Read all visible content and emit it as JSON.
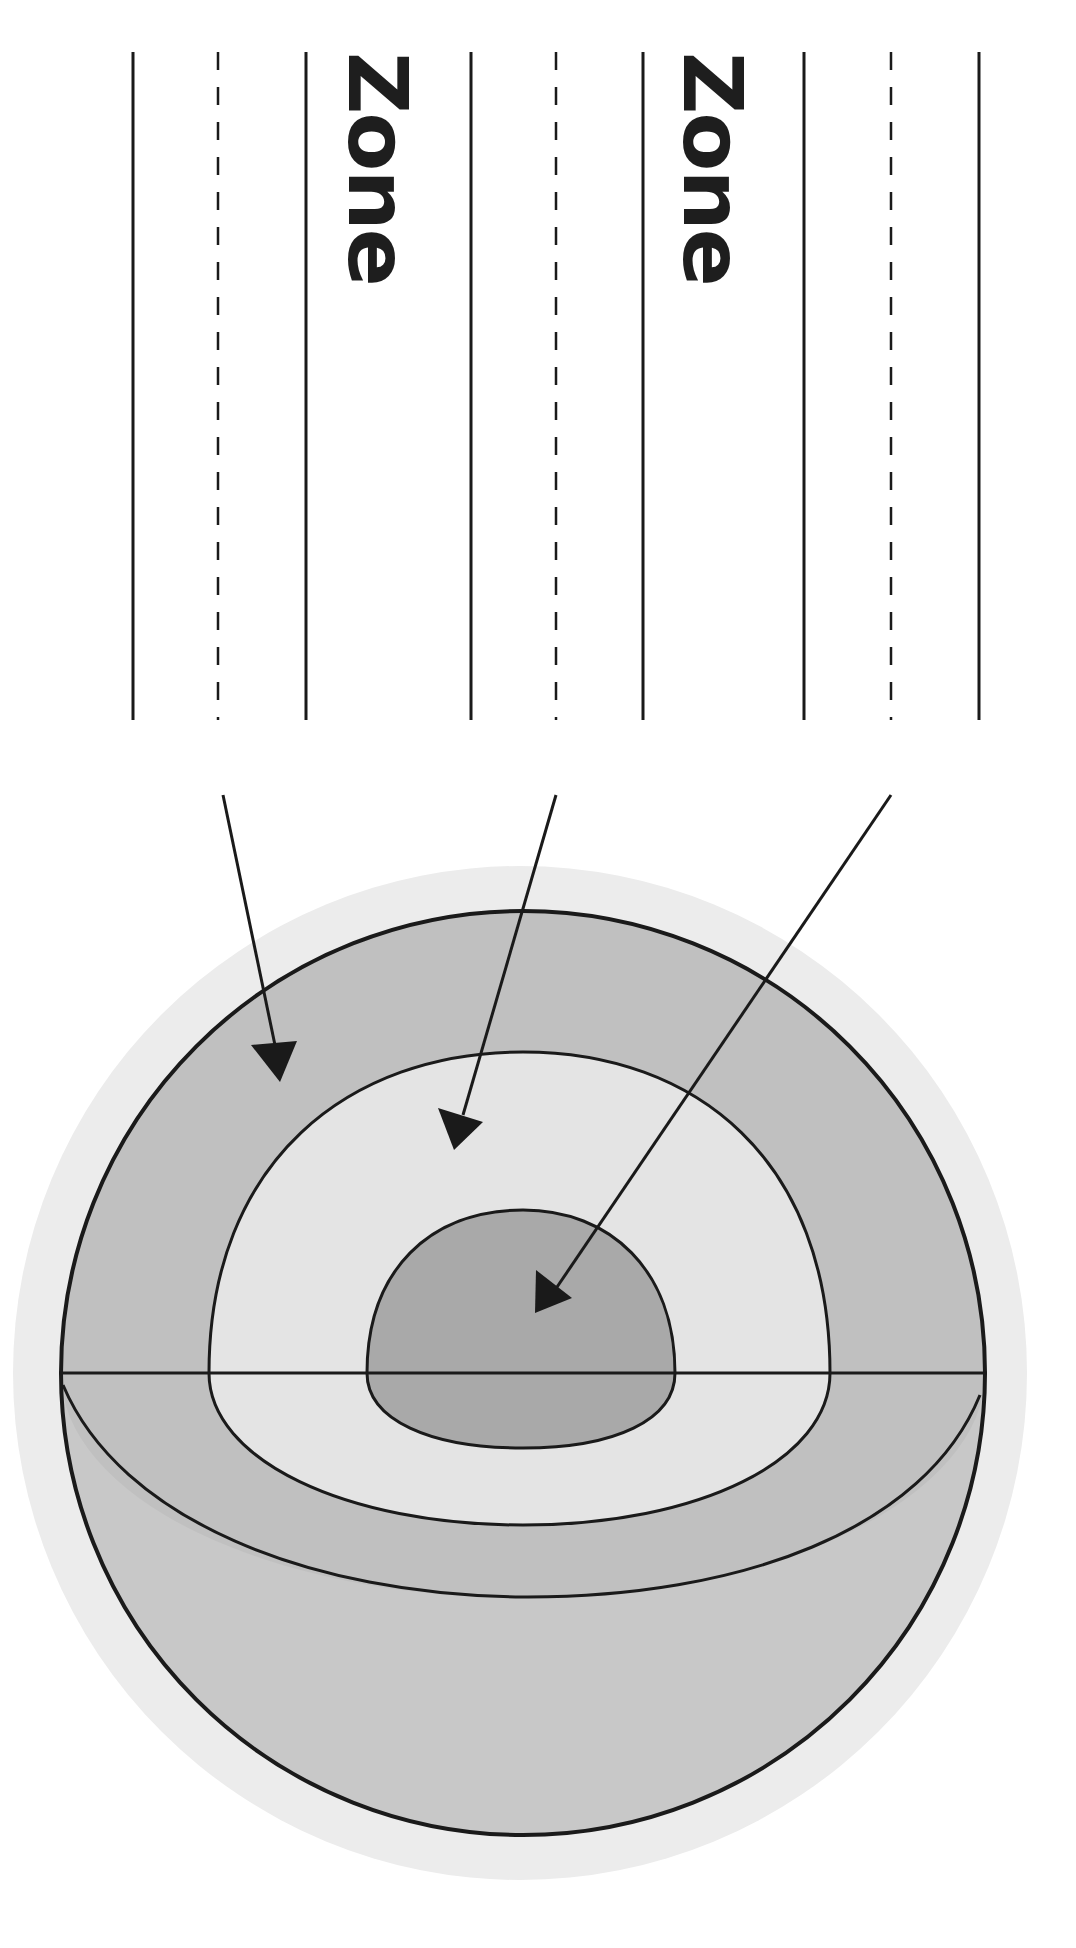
{
  "diagram": {
    "title": "",
    "type": "cross-section labeling worksheet",
    "orientation": "rotated 90 degrees clockwise",
    "labels": [
      {
        "id": "zone-label-1",
        "text": "Zone"
      },
      {
        "id": "zone-label-2",
        "text": "Zone"
      }
    ],
    "answer_line_groups": [
      {
        "id": "group-1",
        "arrow_target": "outer-layer",
        "answer": ""
      },
      {
        "id": "group-2",
        "arrow_target": "middle-layer",
        "answer": ""
      },
      {
        "id": "group-3",
        "arrow_target": "inner-core",
        "answer": ""
      }
    ],
    "layers": [
      {
        "name": "halo",
        "color": "#ececec"
      },
      {
        "name": "outer-layer",
        "color": "#c0c0c0"
      },
      {
        "name": "middle-layer",
        "color": "#e4e4e4"
      },
      {
        "name": "inner-core",
        "color": "#a9a9a9"
      },
      {
        "name": "lower-hemisphere",
        "color": "#c8c8c8"
      }
    ],
    "line_color": "#1a1a1a"
  }
}
